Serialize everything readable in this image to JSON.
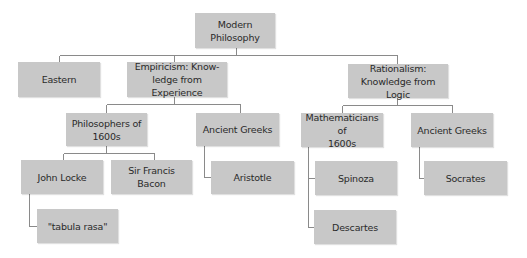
{
  "diagram": {
    "type": "hierarchy-tree",
    "colors": {
      "node_fill": "#c8c8c8",
      "connector": "#8a8a8a",
      "text": "#2a2a2a",
      "background": "#ffffff"
    },
    "nodes": {
      "modern_philosophy": {
        "label": "Modern\nPhilosophy"
      },
      "eastern": {
        "label": "Eastern"
      },
      "empiricism": {
        "label": "Empiricism: Know-\nledge from Experience"
      },
      "rationalism": {
        "label": "Rationalism:\nKnowledge from Logic"
      },
      "philosophers_1600s": {
        "label": "Philosophers of\n1600s"
      },
      "ancient_greeks_empiricism": {
        "label": "Ancient Greeks"
      },
      "mathematicians_1600s": {
        "label": "Mathematicians of\n1600s"
      },
      "ancient_greeks_rationalism": {
        "label": "Ancient Greeks"
      },
      "john_locke": {
        "label": "John Locke"
      },
      "francis_bacon": {
        "label": "Sir Francis Bacon"
      },
      "aristotle": {
        "label": "Aristotle"
      },
      "spinoza": {
        "label": "Spinoza"
      },
      "socrates": {
        "label": "Socrates"
      },
      "tabula_rasa": {
        "label": "\"tabula rasa\""
      },
      "descartes": {
        "label": "Descartes"
      }
    },
    "edges": [
      [
        "modern_philosophy",
        "eastern"
      ],
      [
        "modern_philosophy",
        "empiricism"
      ],
      [
        "modern_philosophy",
        "rationalism"
      ],
      [
        "empiricism",
        "philosophers_1600s"
      ],
      [
        "empiricism",
        "ancient_greeks_empiricism"
      ],
      [
        "rationalism",
        "mathematicians_1600s"
      ],
      [
        "rationalism",
        "ancient_greeks_rationalism"
      ],
      [
        "philosophers_1600s",
        "john_locke"
      ],
      [
        "philosophers_1600s",
        "francis_bacon"
      ],
      [
        "ancient_greeks_empiricism",
        "aristotle"
      ],
      [
        "mathematicians_1600s",
        "spinoza"
      ],
      [
        "mathematicians_1600s",
        "descartes"
      ],
      [
        "ancient_greeks_rationalism",
        "socrates"
      ],
      [
        "john_locke",
        "tabula_rasa"
      ]
    ]
  }
}
